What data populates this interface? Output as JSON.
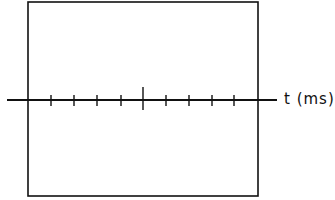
{
  "diagram": {
    "type": "oscilloscope-screen-axis",
    "axis_label": "t (ms)",
    "stroke_color": "#111111",
    "background": "#ffffff",
    "frame": {
      "x": 28,
      "y": 2,
      "width": 230,
      "height": 194
    },
    "axis": {
      "y": 100,
      "x_start": 7,
      "x_end": 277
    },
    "minor_ticks_x": [
      51,
      74,
      97,
      121,
      166,
      189,
      212,
      234
    ],
    "major_tick_x": 143,
    "minor_tick_span": [
      95,
      106
    ],
    "major_tick_span": [
      87,
      110
    ]
  }
}
